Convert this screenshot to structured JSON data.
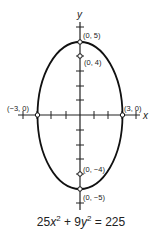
{
  "diagram": {
    "type": "ellipse-graph",
    "axes": {
      "x_label": "x",
      "y_label": "y"
    },
    "points": [
      {
        "label": "(0, 5)",
        "x": 0,
        "y": 5
      },
      {
        "label": "(0, 4)",
        "x": 0,
        "y": 4
      },
      {
        "label": "(−3, 0)",
        "x": -3,
        "y": 0
      },
      {
        "label": "(3, 0)",
        "x": 3,
        "y": 0
      },
      {
        "label": "(0, −4)",
        "x": 0,
        "y": -4
      },
      {
        "label": "(0, −5)",
        "x": 0,
        "y": -5
      }
    ],
    "equation": {
      "c1": "25",
      "v1": "x",
      "e1": "2",
      "op": " + ",
      "c2": "9",
      "v2": "y",
      "e2": "2",
      "rhs": " = 225"
    }
  }
}
